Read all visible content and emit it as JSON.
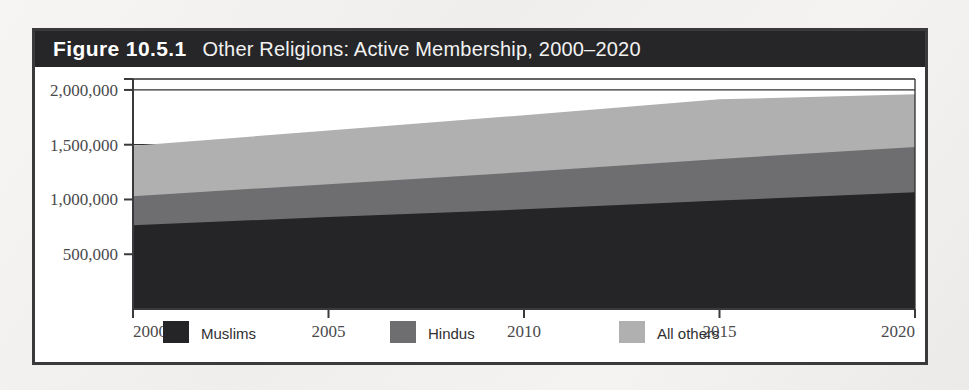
{
  "figure": {
    "number": "Figure 10.5.1",
    "title": "Other Religions: Active Membership, 2000–2020"
  },
  "colors": {
    "frame": "#3a3a3c",
    "title_bar": "#262628",
    "muslims": "#252527",
    "hindus": "#6e6e70",
    "all_others": "#b0b0b0",
    "axis": "#3a3a3c",
    "gridline": "#2f2f31",
    "page_background": "#f3f2f0",
    "plot_background": "#ffffff"
  },
  "legend": {
    "position": "bottom",
    "items": [
      {
        "label": "Muslims",
        "swatch": "#252527"
      },
      {
        "label": "Hindus",
        "swatch": "#6e6e70"
      },
      {
        "label": "All others",
        "swatch": "#b0b0b0"
      }
    ]
  },
  "axes": {
    "y_ticks": [
      "500,000",
      "1,000,000",
      "1,500,000",
      "2,000,000"
    ],
    "x_ticks": [
      "2000",
      "2005",
      "2010",
      "2015",
      "2020"
    ]
  },
  "chart_data": {
    "type": "area",
    "stacked": true,
    "title": "Other Religions: Active Membership, 2000–2020",
    "xlabel": "",
    "ylabel": "",
    "x": [
      2000,
      2005,
      2010,
      2015,
      2020
    ],
    "xlim": [
      2000,
      2020
    ],
    "ylim": [
      0,
      2100000
    ],
    "ytick_values": [
      500000,
      1000000,
      1500000,
      2000000
    ],
    "ytick_labels": [
      "500,000",
      "1,000,000",
      "1,500,000",
      "2,000,000"
    ],
    "xtick_values": [
      2000,
      2005,
      2010,
      2015,
      2020
    ],
    "xtick_labels": [
      "2000",
      "2005",
      "2010",
      "2015",
      "2020"
    ],
    "grid": true,
    "grid_axis": "y",
    "legend_position": "bottom",
    "series": [
      {
        "name": "Muslims",
        "color": "#252527",
        "values": [
          765000,
          840000,
          910000,
          990000,
          1065000
        ]
      },
      {
        "name": "Hindus",
        "color": "#6e6e70",
        "values": [
          265000,
          300000,
          340000,
          380000,
          415000
        ]
      },
      {
        "name": "All others",
        "color": "#b0b0b0",
        "values": [
          460000,
          490000,
          520000,
          545000,
          480000
        ]
      }
    ],
    "cumulative_tops": [
      {
        "name": "Muslims",
        "values": [
          765000,
          840000,
          910000,
          990000,
          1065000
        ]
      },
      {
        "name": "Hindus",
        "values": [
          1030000,
          1140000,
          1250000,
          1370000,
          1480000
        ]
      },
      {
        "name": "All others",
        "values": [
          1490000,
          1630000,
          1770000,
          1915000,
          1960000
        ]
      }
    ]
  }
}
